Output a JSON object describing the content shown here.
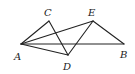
{
  "diagram": {
    "points": {
      "A": {
        "x": 21,
        "y": 44,
        "label": "A",
        "lx": 14,
        "ly": 60
      },
      "C": {
        "x": 49,
        "y": 21,
        "label": "C",
        "lx": 44,
        "ly": 16
      },
      "E": {
        "x": 93,
        "y": 21,
        "label": "E",
        "lx": 88,
        "ly": 16
      },
      "D": {
        "x": 68,
        "y": 55,
        "label": "D",
        "lx": 63,
        "ly": 70
      },
      "B": {
        "x": 124,
        "y": 44,
        "label": "B",
        "lx": 120,
        "ly": 58
      }
    },
    "segments": [
      [
        "A",
        "C"
      ],
      [
        "C",
        "D"
      ],
      [
        "A",
        "D"
      ],
      [
        "A",
        "E"
      ],
      [
        "A",
        "B"
      ],
      [
        "D",
        "E"
      ],
      [
        "E",
        "B"
      ]
    ],
    "colors": {
      "stroke": "#222222",
      "background": "#ffffff"
    }
  }
}
